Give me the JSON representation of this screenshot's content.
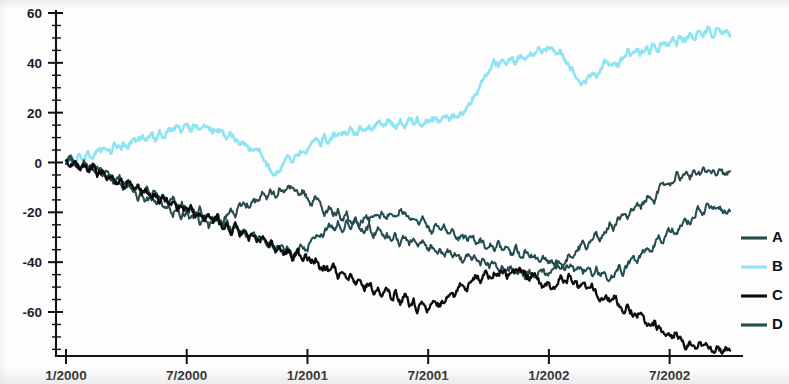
{
  "chart_data": {
    "type": "line",
    "title": "",
    "subtitle": "",
    "xlabel": "",
    "ylabel": "",
    "xlim": [
      0,
      33
    ],
    "ylim": [
      -80,
      60
    ],
    "grid": false,
    "legend_position": "right",
    "x_tick_labels": [
      "1/2000",
      "7/2000",
      "1/2001",
      "7/2001",
      "1/2002",
      "7/2002"
    ],
    "x_tick_values": [
      0,
      6,
      12,
      18,
      24,
      30
    ],
    "y_tick_labels": [
      "60",
      "40",
      "20",
      "0",
      "-20",
      "-40",
      "-60"
    ],
    "y_tick_values": [
      60,
      40,
      20,
      0,
      -20,
      -40,
      -60
    ],
    "y_minor_step": 5,
    "units": "percent",
    "series": [
      {
        "name": "A",
        "color": "#2b4a4c",
        "values": [
          0.0,
          1.5,
          -0.5,
          -3.0,
          0.5,
          -1.5,
          -4.0,
          -2.0,
          -5.5,
          -3.5,
          -6.5,
          -9.0,
          -7.0,
          -10.5,
          -8.5,
          -12.0,
          -14.5,
          -12.5,
          -16.0,
          -13.5,
          -17.0,
          -15.0,
          -18.5,
          -16.5,
          -20.0,
          -18.0,
          -21.5,
          -19.5,
          -23.0,
          -21.0,
          -24.5,
          -22.5,
          -26.0,
          -24.0,
          -22.0,
          -24.5,
          -21.5,
          -19.0,
          -21.0,
          -18.0,
          -15.5,
          -17.5,
          -14.0,
          -16.0,
          -12.5,
          -14.5,
          -11.0,
          -13.0,
          -10.0,
          -12.0,
          -9.0,
          -11.5,
          -13.5,
          -11.0,
          -14.0,
          -16.5,
          -14.5,
          -17.5,
          -20.0,
          -18.0,
          -21.5,
          -19.5,
          -23.0,
          -21.0,
          -24.5,
          -22.5,
          -26.0,
          -28.0,
          -26.0,
          -29.0,
          -27.0,
          -30.0,
          -28.5,
          -31.5,
          -29.5,
          -32.5,
          -30.5,
          -33.5,
          -31.5,
          -34.5,
          -32.5,
          -35.5,
          -33.5,
          -36.5,
          -34.5,
          -37.5,
          -35.5,
          -38.5,
          -36.5,
          -39.5,
          -37.0,
          -40.0,
          -38.0,
          -41.0,
          -39.0,
          -42.0,
          -40.0,
          -43.0,
          -41.0,
          -44.0,
          -42.0,
          -45.0,
          -43.0,
          -46.5,
          -44.0,
          -47.0,
          -45.0,
          -43.0,
          -45.5,
          -42.5,
          -40.0,
          -42.5,
          -39.0,
          -36.5,
          -38.5,
          -35.0,
          -32.5,
          -34.5,
          -31.0,
          -28.5,
          -30.5,
          -27.0,
          -24.5,
          -26.5,
          -23.0,
          -20.5,
          -22.5,
          -19.0,
          -16.5,
          -18.5,
          -15.0,
          -12.5,
          -14.5,
          -11.0,
          -8.5,
          -10.5,
          -7.0,
          -5.0,
          -6.5,
          -4.0,
          -5.5,
          -3.5,
          -5.0,
          -3.0,
          -4.5,
          -3.0,
          -4.0,
          -3.5,
          -4.5,
          -3.5
        ]
      },
      {
        "name": "B",
        "color": "#8fe4f2",
        "values": [
          0.0,
          2.0,
          0.5,
          3.0,
          1.5,
          4.0,
          2.5,
          5.0,
          3.5,
          6.0,
          4.5,
          7.0,
          5.5,
          8.0,
          6.5,
          9.0,
          7.5,
          10.0,
          8.5,
          11.0,
          9.5,
          12.0,
          10.5,
          13.0,
          12.0,
          14.0,
          12.5,
          14.5,
          13.0,
          15.0,
          13.5,
          15.5,
          14.0,
          12.5,
          14.0,
          12.0,
          10.0,
          11.5,
          9.0,
          7.0,
          8.5,
          6.0,
          4.0,
          5.5,
          3.0,
          -1.0,
          -3.5,
          -5.5,
          -3.0,
          -0.5,
          2.0,
          0.0,
          3.0,
          5.5,
          3.5,
          6.5,
          9.0,
          7.0,
          10.0,
          8.0,
          11.0,
          9.5,
          12.0,
          10.5,
          13.0,
          11.5,
          14.0,
          12.5,
          15.0,
          13.5,
          16.0,
          14.5,
          17.0,
          15.5,
          14.0,
          16.0,
          14.5,
          16.5,
          15.0,
          17.0,
          15.5,
          17.5,
          16.0,
          18.0,
          16.5,
          18.5,
          17.0,
          19.0,
          17.5,
          20.0,
          22.0,
          25.0,
          28.0,
          31.0,
          34.0,
          37.0,
          40.0,
          38.5,
          41.0,
          39.5,
          42.0,
          40.5,
          43.0,
          41.5,
          44.0,
          42.5,
          45.0,
          43.5,
          46.0,
          44.5,
          42.0,
          44.5,
          41.5,
          39.0,
          36.0,
          33.5,
          31.0,
          33.5,
          36.0,
          34.0,
          37.0,
          40.0,
          38.0,
          41.0,
          39.0,
          42.0,
          44.5,
          42.5,
          45.5,
          43.5,
          46.5,
          44.5,
          47.5,
          45.5,
          48.5,
          46.5,
          49.5,
          47.5,
          50.5,
          48.5,
          51.5,
          49.5,
          52.5,
          50.5,
          53.5,
          51.0,
          54.0,
          51.5,
          53.0,
          50.5
        ]
      },
      {
        "name": "C",
        "color": "#0c0c0c",
        "values": [
          0.0,
          -1.0,
          1.0,
          -2.5,
          -0.5,
          -3.5,
          -1.5,
          -5.0,
          -3.0,
          -6.5,
          -4.5,
          -8.0,
          -6.0,
          -9.5,
          -7.5,
          -11.0,
          -9.0,
          -12.5,
          -10.5,
          -14.0,
          -12.0,
          -15.5,
          -13.5,
          -17.0,
          -15.0,
          -18.5,
          -16.5,
          -20.0,
          -18.0,
          -21.5,
          -19.5,
          -23.0,
          -21.0,
          -24.5,
          -22.5,
          -26.0,
          -24.0,
          -27.5,
          -25.5,
          -29.0,
          -27.0,
          -30.5,
          -28.5,
          -32.0,
          -30.0,
          -33.5,
          -31.5,
          -35.0,
          -33.0,
          -36.5,
          -35.0,
          -38.0,
          -36.0,
          -39.5,
          -37.5,
          -41.0,
          -39.0,
          -42.5,
          -41.0,
          -44.0,
          -42.5,
          -45.5,
          -44.0,
          -47.0,
          -45.0,
          -48.5,
          -46.5,
          -50.0,
          -48.0,
          -51.5,
          -49.5,
          -53.0,
          -51.0,
          -54.5,
          -52.5,
          -56.0,
          -54.0,
          -57.5,
          -55.5,
          -59.0,
          -57.0,
          -60.5,
          -58.5,
          -56.0,
          -58.0,
          -55.0,
          -52.5,
          -54.5,
          -51.0,
          -48.5,
          -50.5,
          -47.5,
          -45.0,
          -47.0,
          -44.0,
          -46.0,
          -43.5,
          -45.5,
          -43.0,
          -45.0,
          -42.5,
          -44.5,
          -42.0,
          -44.0,
          -46.5,
          -44.5,
          -47.5,
          -50.0,
          -48.0,
          -51.0,
          -48.5,
          -46.0,
          -48.5,
          -45.5,
          -48.0,
          -50.5,
          -48.5,
          -51.5,
          -49.0,
          -52.0,
          -54.5,
          -52.5,
          -55.5,
          -53.5,
          -56.5,
          -59.0,
          -57.0,
          -60.0,
          -62.5,
          -60.5,
          -63.5,
          -66.0,
          -64.0,
          -67.0,
          -69.5,
          -67.5,
          -70.5,
          -68.0,
          -71.0,
          -73.5,
          -71.5,
          -74.5,
          -72.0,
          -75.0,
          -73.0,
          -75.5,
          -73.5,
          -76.0,
          -74.0,
          -75.5
        ]
      },
      {
        "name": "D",
        "color": "#1f4f52",
        "values": [
          0.0,
          2.0,
          0.0,
          -2.0,
          -0.5,
          -3.0,
          -1.0,
          -4.5,
          -2.5,
          -6.0,
          -4.0,
          -7.5,
          -5.5,
          -9.0,
          -7.0,
          -10.5,
          -8.5,
          -12.0,
          -10.0,
          -13.5,
          -11.5,
          -15.0,
          -13.0,
          -16.5,
          -14.5,
          -18.0,
          -16.0,
          -19.5,
          -17.5,
          -21.0,
          -19.0,
          -22.5,
          -20.5,
          -24.0,
          -22.0,
          -25.5,
          -24.0,
          -27.0,
          -25.0,
          -28.5,
          -26.5,
          -30.0,
          -28.0,
          -31.5,
          -29.5,
          -33.0,
          -31.0,
          -34.5,
          -32.5,
          -36.0,
          -34.0,
          -37.5,
          -35.5,
          -33.0,
          -35.0,
          -32.0,
          -29.5,
          -31.5,
          -28.0,
          -25.5,
          -27.5,
          -24.0,
          -26.5,
          -23.5,
          -25.5,
          -22.5,
          -24.5,
          -21.5,
          -23.5,
          -20.5,
          -22.5,
          -20.0,
          -22.0,
          -19.5,
          -21.5,
          -19.0,
          -21.0,
          -23.5,
          -21.0,
          -24.0,
          -22.0,
          -25.0,
          -27.5,
          -25.5,
          -28.5,
          -26.5,
          -29.5,
          -27.5,
          -30.5,
          -28.5,
          -31.5,
          -29.5,
          -32.5,
          -30.5,
          -33.5,
          -31.5,
          -34.5,
          -32.5,
          -35.5,
          -33.5,
          -36.5,
          -34.5,
          -37.5,
          -35.5,
          -38.5,
          -36.5,
          -39.5,
          -37.5,
          -40.5,
          -38.5,
          -41.5,
          -39.5,
          -42.5,
          -40.5,
          -43.5,
          -41.5,
          -44.5,
          -42.0,
          -45.0,
          -43.0,
          -46.0,
          -44.0,
          -47.0,
          -44.5,
          -42.0,
          -44.0,
          -41.0,
          -38.5,
          -40.5,
          -37.0,
          -34.5,
          -36.5,
          -33.0,
          -30.5,
          -32.5,
          -29.0,
          -26.5,
          -28.5,
          -25.0,
          -22.5,
          -24.5,
          -21.0,
          -18.5,
          -20.5,
          -17.0,
          -19.0,
          -16.5,
          -18.5,
          -20.0,
          -19.5
        ]
      }
    ]
  },
  "legend": {
    "entries": [
      {
        "label": "A",
        "color": "#2b4a4c"
      },
      {
        "label": "B",
        "color": "#8fe4f2"
      },
      {
        "label": "C",
        "color": "#0c0c0c"
      },
      {
        "label": "D",
        "color": "#1f4f52"
      }
    ]
  }
}
